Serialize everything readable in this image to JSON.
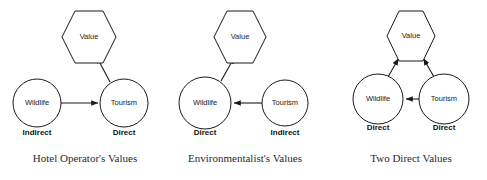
{
  "figure": {
    "width": 487,
    "height": 180,
    "background": "#ffffff",
    "stroke_color": "#1a1a1a"
  },
  "panels": [
    {
      "id": "hotel-operator",
      "caption": "Hotel Operator's Values",
      "caption_x": 85,
      "caption_y": 152,
      "nodes": {
        "value": {
          "label": "Value",
          "cx": 89,
          "cy": 37,
          "rx": 27,
          "ry": 26,
          "shape": "hexagon"
        },
        "wildlife": {
          "label": "Wildlife",
          "cx": 37,
          "cy": 103,
          "r": 24,
          "shape": "circle"
        },
        "tourism": {
          "label": "Tourism",
          "cx": 124,
          "cy": 103,
          "r": 24,
          "shape": "circle"
        }
      },
      "edges": [
        {
          "from": "wildlife",
          "to": "tourism",
          "arrow": "to"
        },
        {
          "from": "tourism",
          "to": "value",
          "arrow": "to"
        }
      ],
      "role_labels": [
        {
          "text": "Indirect",
          "x": 37,
          "y": 131
        },
        {
          "text": "Direct",
          "x": 124,
          "y": 131
        }
      ]
    },
    {
      "id": "environmentalist",
      "caption": "Environmentalist's Values",
      "caption_x": 245,
      "caption_y": 152,
      "nodes": {
        "value": {
          "label": "Value",
          "cx": 240,
          "cy": 37,
          "rx": 26,
          "ry": 26,
          "shape": "hexagon"
        },
        "wildlife": {
          "label": "Wildlife",
          "cx": 205,
          "cy": 103,
          "r": 26,
          "shape": "circle"
        },
        "tourism": {
          "label": "Tourism",
          "cx": 285,
          "cy": 103,
          "r": 23,
          "shape": "circle"
        }
      },
      "edges": [
        {
          "from": "tourism",
          "to": "wildlife",
          "arrow": "to"
        },
        {
          "from": "wildlife",
          "to": "value",
          "arrow": "to"
        }
      ],
      "role_labels": [
        {
          "text": "Direct",
          "x": 205,
          "y": 131
        },
        {
          "text": "Indirect",
          "x": 285,
          "y": 131
        }
      ]
    },
    {
      "id": "two-direct",
      "caption": "Two Direct Values",
      "caption_x": 411,
      "caption_y": 152,
      "nodes": {
        "value": {
          "label": "Value",
          "cx": 411,
          "cy": 36,
          "rx": 24,
          "ry": 25,
          "shape": "hexagon"
        },
        "wildlife": {
          "label": "Wildlife",
          "cx": 378,
          "cy": 99,
          "r": 25,
          "shape": "circle"
        },
        "tourism": {
          "label": "Tourism",
          "cx": 444,
          "cy": 99,
          "r": 25,
          "shape": "circle"
        }
      },
      "edges": [
        {
          "from": "tourism",
          "to": "wildlife",
          "arrow": "to"
        },
        {
          "from": "wildlife",
          "to": "value",
          "arrow": "to"
        },
        {
          "from": "tourism",
          "to": "value",
          "arrow": "to"
        }
      ],
      "role_labels": [
        {
          "text": "Direct",
          "x": 378,
          "y": 126
        },
        {
          "text": "Direct",
          "x": 444,
          "y": 126
        }
      ]
    }
  ]
}
